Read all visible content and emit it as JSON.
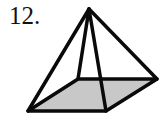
{
  "problem": {
    "number_label": "12."
  },
  "figure": {
    "type": "square-pyramid",
    "base_fill": "#c8c8c8",
    "stroke": "#0a0a0a",
    "vertices": {
      "apex": [
        89,
        9
      ],
      "base_front_left": [
        28,
        111
      ],
      "base_front_right": [
        106,
        111
      ],
      "base_back_right": [
        157,
        79
      ],
      "base_back_left": [
        78,
        79
      ]
    }
  }
}
